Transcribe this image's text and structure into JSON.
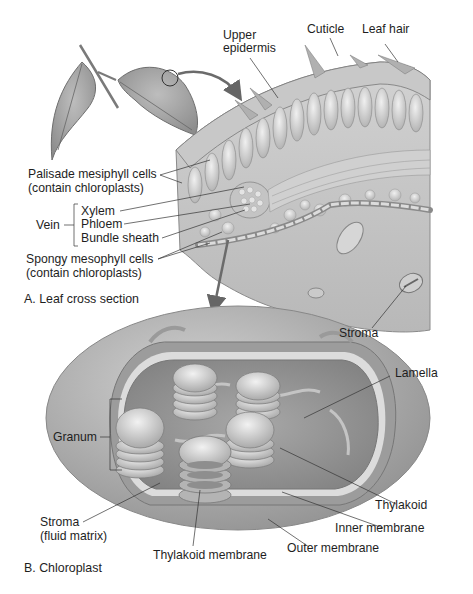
{
  "figure": {
    "panel_a": {
      "caption": "A. Leaf cross section",
      "labels": {
        "upper_epidermis_1": "Upper",
        "upper_epidermis_2": "epidermis",
        "cuticle": "Cuticle",
        "leaf_hair": "Leaf hair",
        "palisade_1": "Palisade mesiphyll cells",
        "palisade_2": "(contain chloroplasts)",
        "vein": "Vein",
        "xylem": "Xylem",
        "phloem": "Phloem",
        "bundle_sheath": "Bundle sheath",
        "spongy_1": "Spongy mesophyll cells",
        "spongy_2": "(contain chloroplasts)",
        "stroma": "Stroma"
      }
    },
    "panel_b": {
      "caption": "B. Chloroplast",
      "labels": {
        "lamella": "Lamella",
        "granum": "Granum",
        "thylakoid": "Thylakoid",
        "inner_membrane": "Inner membrane",
        "outer_membrane": "Outer membrane",
        "thylakoid_membrane": "Thylakoid membrane",
        "stroma_1": "Stroma",
        "stroma_2": "(fluid matrix)"
      }
    },
    "colors": {
      "background": "#ffffff",
      "tissue_light": "#d6d6d6",
      "tissue_mid": "#b3b3b3",
      "tissue_dark": "#8a8a8a",
      "leader_line": "#333333",
      "arrow": "#6b6b6b"
    }
  }
}
